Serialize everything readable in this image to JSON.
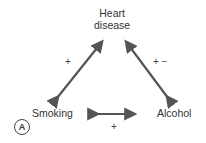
{
  "diagram": {
    "nodes": {
      "heart_disease_line1": "Heart",
      "heart_disease_line2": "disease",
      "smoking": "Smoking",
      "alcohol": "Alcohol"
    },
    "edges": [
      {
        "from": "Smoking",
        "to": "Heart disease",
        "label": "+"
      },
      {
        "from": "Alcohol",
        "to": "Heart disease",
        "label": "+ −"
      },
      {
        "from": "Smoking",
        "to": "Alcohol",
        "label": "+"
      }
    ],
    "panel_label": "A",
    "colors": {
      "arrow": "#555555",
      "text": "#333333"
    }
  }
}
